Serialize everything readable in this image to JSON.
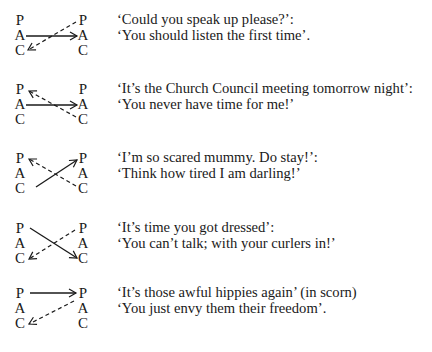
{
  "diagram": {
    "ego_states": [
      "P",
      "A",
      "C"
    ],
    "transactions": [
      {
        "stimulus": "‘Could you speak up please?’:",
        "response": "‘You should listen the first time’.",
        "stimulus_arrow": {
          "from": "A",
          "to": "A",
          "style": "solid"
        },
        "response_arrow": {
          "from": "P",
          "to": "C",
          "style": "dashed"
        }
      },
      {
        "stimulus": "‘It’s the Church Council meeting tomorrow night’:",
        "response": "‘You never have time for me!’",
        "stimulus_arrow": {
          "from": "A",
          "to": "A",
          "style": "solid"
        },
        "response_arrow": {
          "from": "C",
          "to": "P",
          "style": "dashed"
        }
      },
      {
        "stimulus": "‘I’m so scared mummy. Do stay!’:",
        "response": "‘Think how tired I am darling!’",
        "stimulus_arrow": {
          "from": "C",
          "to": "P",
          "style": "solid"
        },
        "response_arrow": {
          "from": "C",
          "to": "P",
          "style": "dashed"
        }
      },
      {
        "stimulus": "‘It’s time you got dressed’:",
        "response": "‘You can’t talk; with your curlers in!’",
        "stimulus_arrow": {
          "from": "P",
          "to": "C",
          "style": "solid"
        },
        "response_arrow": {
          "from": "P",
          "to": "C",
          "style": "dashed"
        }
      },
      {
        "stimulus": "‘It’s those awful hippies again’ (in scorn)",
        "response": "‘You just envy them their freedom’.",
        "stimulus_arrow": {
          "from": "P",
          "to": "P",
          "style": "solid"
        },
        "response_arrow": {
          "from": "P",
          "to": "C",
          "style": "dashed"
        }
      }
    ]
  }
}
